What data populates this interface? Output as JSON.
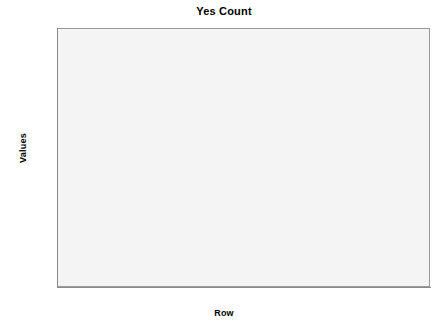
{
  "chart_data": {
    "type": "bar",
    "title": "Yes Count",
    "xlabel": "Row",
    "ylabel": "Values",
    "categories": [
      "The Student Eatery",
      "The Wholefood Café",
      "The Hub",
      "Racquets Retreat",
      "The Media Munch"
    ],
    "values": [
      121,
      89,
      57,
      30,
      85
    ],
    "ylim": [
      0,
      138
    ],
    "yticks": [
      0,
      20,
      40,
      60,
      80,
      100,
      120
    ],
    "ytick_labels": [
      "0",
      "20",
      "40",
      "60",
      "80",
      "100",
      "120"
    ],
    "grid": false,
    "legend": null,
    "colors": {
      "bar_fill": "#bcbcbc",
      "bar_edge": "#555555",
      "plot_background": "#f4f4f4",
      "frame": "#9a9a9a",
      "axis": "#8a8a8a",
      "text": "#000000",
      "figure_background": "#ffffff"
    }
  }
}
